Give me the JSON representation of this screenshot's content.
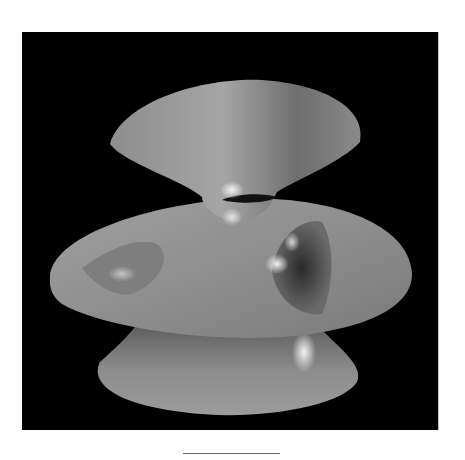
{
  "figure": {
    "background_color": "#000000",
    "surface_color": "#9a9a9a",
    "highlight_color": "#f2f2f2",
    "page_color": "#ffffff"
  },
  "caption": {
    "text": ""
  }
}
